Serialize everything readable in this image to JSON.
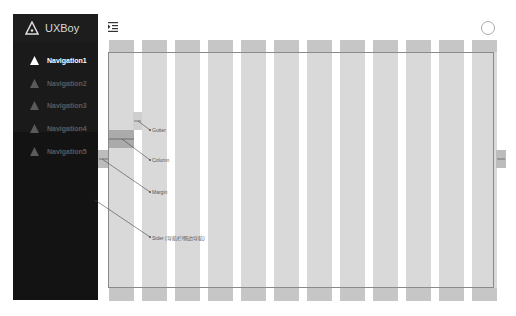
{
  "brand": {
    "name": "UXBoy",
    "icon": "triangle-logo-icon"
  },
  "sidebar": {
    "items": [
      {
        "label": "Navigation1",
        "active": true
      },
      {
        "label": "Navigation2",
        "active": false
      },
      {
        "label": "Navigation3",
        "active": false
      },
      {
        "label": "Navigation4",
        "active": false
      },
      {
        "label": "Navigation5",
        "active": false
      }
    ]
  },
  "header": {
    "toggle_icon": "menu-fold-icon",
    "avatar_icon": "user-avatar-icon"
  },
  "grid": {
    "columns": 12,
    "column_color": "#d9d9d9",
    "header_color": "#c6c6c6"
  },
  "annotations": {
    "gutter": "Gutter",
    "column": "Column",
    "margin": "Margin",
    "sider": "Sider (导航栏/侧边导航)"
  },
  "colors": {
    "sider_bg": "#1a1a1a",
    "nav_active": "#ffffff",
    "nav_inactive": "#5a5a5a"
  }
}
